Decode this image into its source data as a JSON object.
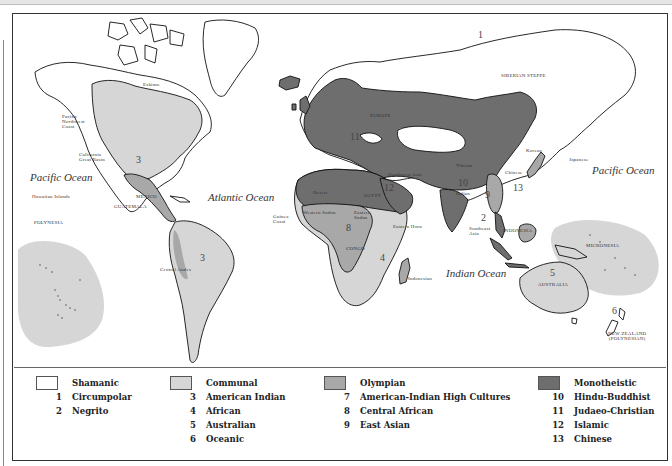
{
  "map": {
    "oceans": {
      "pacific_west": "Pacific Ocean",
      "atlantic": "Atlantic Ocean",
      "pacific_east": "Pacific Ocean",
      "indian": "Indian Ocean"
    },
    "region_labels": {
      "eskimo": "Eskimo",
      "pacific_northwest": "Pacific\nNorthwest\nCoast",
      "california": "California\nGreat Basin",
      "hawaiian": "Hawaiian Islands",
      "polynesia": "POLYNESIA",
      "mexico": "MEXICO",
      "guatemala": "GUATEMALA",
      "central_andes": "Central Andes",
      "guinea_coast": "Guinea\nCoast",
      "western_sudan": "Western Sudan",
      "desert": "Desert",
      "egypt": "EGYPT",
      "eastern_sudan": "Eastern\nSudan",
      "eastern_horn": "Eastern Horn",
      "congo": "CONGO",
      "indonesian": "Indonesian",
      "europe": "EUROPE",
      "southwest_asia": "Southwest Asia",
      "tibetan": "Tibetan",
      "indian": "Indian",
      "chinese": "Chinese",
      "korean": "Korean",
      "japanese": "Japanese",
      "southeast_asia": "Southeast\nAsia",
      "indonesia": "INDONESIA",
      "siberian_steppe": "SIBERIAN STEPPE",
      "micronesia": "MICRONESIA",
      "australia": "AUSTRALIA",
      "new_zealand": "NEW ZEALAND\n(POLYNESIAN)"
    },
    "region_numbers": {
      "n1": "1",
      "n2": "2",
      "n3a": "3",
      "n3b": "3",
      "n4": "4",
      "n5": "5",
      "n6": "6",
      "n8": "8",
      "n9": "9",
      "n10": "10",
      "n11": "11",
      "n12": "12",
      "n13": "13"
    },
    "colors": {
      "shamanic": "#ffffff",
      "communal": "#d6d6d6",
      "olympian": "#a8a8a8",
      "monotheistic": "#6e6e6e",
      "outline": "#111111"
    }
  },
  "legend": {
    "groups": [
      {
        "title": "Shamanic",
        "color": "#ffffff",
        "items": [
          {
            "num": "1",
            "label": "Circumpolar"
          },
          {
            "num": "2",
            "label": "Negrito"
          }
        ]
      },
      {
        "title": "Communal",
        "color": "#d6d6d6",
        "items": [
          {
            "num": "3",
            "label": "American Indian"
          },
          {
            "num": "4",
            "label": "African"
          },
          {
            "num": "5",
            "label": "Australian"
          },
          {
            "num": "6",
            "label": "Oceanic"
          }
        ]
      },
      {
        "title": "Olympian",
        "color": "#a8a8a8",
        "items": [
          {
            "num": "7",
            "label": "American-Indian High Cultures"
          },
          {
            "num": "8",
            "label": "Central African"
          },
          {
            "num": "9",
            "label": "East Asian"
          }
        ]
      },
      {
        "title": "Monotheistic",
        "color": "#6e6e6e",
        "items": [
          {
            "num": "10",
            "label": "Hindu-Buddhist"
          },
          {
            "num": "11",
            "label": "Judaeo-Christian"
          },
          {
            "num": "12",
            "label": "Islamic"
          },
          {
            "num": "13",
            "label": "Chinese"
          }
        ]
      }
    ]
  }
}
